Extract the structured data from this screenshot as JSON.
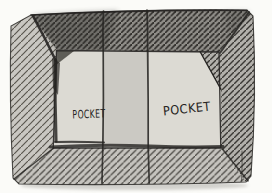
{
  "figure": {
    "labels": {
      "left_pocket": "POCKET",
      "right_pocket": "POCKET"
    },
    "colors": {
      "paper": "#fbfbf8",
      "frame_top": "#908e89",
      "frame_left": "#c9c7c2",
      "frame_right": "#b2b0ab",
      "frame_bottom": "#c5c3be",
      "hatch_top": "#2e2c29",
      "hatch_left": "#59564f",
      "hatch_right": "#3b3936",
      "hatch_bottom": "#4a4843",
      "interior": "#d7d5cf",
      "pocket": "#dcdad3",
      "middle_panel": "#cbc9c3",
      "ink": "#262422",
      "shadow": "#a9a7a2"
    }
  }
}
